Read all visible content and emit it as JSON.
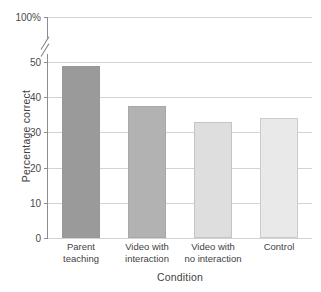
{
  "chart_data": {
    "type": "bar",
    "title": "",
    "xlabel": "Condition",
    "ylabel": "Percentage correct",
    "categories": [
      "Parent teaching",
      "Video with interaction",
      "Video with no interaction",
      "Control"
    ],
    "category_lines": [
      [
        "Parent",
        "teaching"
      ],
      [
        "Video with",
        "interaction"
      ],
      [
        "Video with",
        "no interaction"
      ],
      [
        "Control",
        ""
      ]
    ],
    "values": [
      49,
      37.5,
      33,
      34
    ],
    "bar_colors": [
      "#9a9a9a",
      "#b2b2b2",
      "#dedede",
      "#e9e9e9"
    ],
    "ylim": [
      0,
      100
    ],
    "axis_break": {
      "present": true,
      "from": 50,
      "to": 100
    },
    "ytick_labels": [
      "0",
      "10",
      "20",
      "30",
      "40",
      "50",
      "100%"
    ],
    "ytick_values": [
      0,
      10,
      20,
      30,
      40,
      50,
      100
    ],
    "grid": true,
    "grid_color": "#d3d3d3",
    "axis_color": "#8d8d8d",
    "legend": "none"
  }
}
